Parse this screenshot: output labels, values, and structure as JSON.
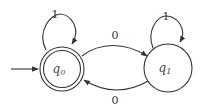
{
  "diagram": {
    "type": "finite-automaton",
    "states": [
      {
        "id": "q0",
        "label_main": "q",
        "label_sub": "0",
        "initial": true,
        "accepting": true
      },
      {
        "id": "q1",
        "label_main": "q",
        "label_sub": "1",
        "initial": false,
        "accepting": false
      }
    ],
    "transitions": [
      {
        "from": "q0",
        "to": "q0",
        "label": "1"
      },
      {
        "from": "q0",
        "to": "q1",
        "label": "0"
      },
      {
        "from": "q1",
        "to": "q1",
        "label": "1"
      },
      {
        "from": "q1",
        "to": "q0",
        "label": "0"
      }
    ],
    "colors": {
      "stroke": "#333333",
      "background": "#ffffff"
    }
  }
}
